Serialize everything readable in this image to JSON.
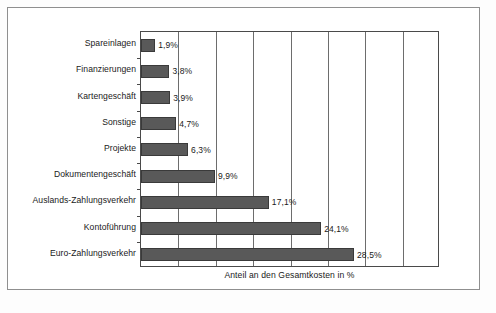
{
  "chart_data": {
    "type": "bar",
    "orientation": "horizontal",
    "title": "",
    "xlabel": "Anteil an den Gesamtkosten in %",
    "ylabel": "",
    "xlim": [
      0,
      40
    ],
    "grid": true,
    "gridline_interval": 5,
    "legend": false,
    "value_suffix": "%",
    "decimal_separator": ",",
    "categories": [
      "Spareinlagen",
      "Finanzierungen",
      "Kartengeschäft",
      "Sonstige",
      "Projekte",
      "Dokumentengeschäft",
      "Auslands-Zahlungsverkehr",
      "Kontoführung",
      "Euro-Zahlungsverkehr"
    ],
    "values": [
      1.9,
      3.8,
      3.9,
      4.7,
      6.3,
      9.9,
      17.1,
      24.1,
      28.5
    ],
    "value_labels": [
      "1,9%",
      "3,8%",
      "3,9%",
      "4,7%",
      "6,3%",
      "9,9%",
      "17,1%",
      "24,1%",
      "28,5%"
    ]
  },
  "style": {
    "bar_color": "#595959",
    "bar_edge_color": "#3a3a3a",
    "grid_color": "#6d6d6d",
    "axis_color": "#4a4a4a",
    "frame_color": "#8f8f8f",
    "text_color": "#1a1a1a",
    "background": "#ffffff"
  }
}
